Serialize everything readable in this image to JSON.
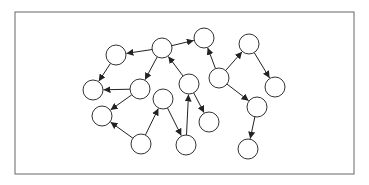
{
  "diagram": {
    "type": "directed-graph",
    "frame": {
      "x": 15,
      "y": 12,
      "width": 339,
      "height": 162,
      "stroke": "#666666"
    },
    "node_radius": 10,
    "node_stroke": "#333333",
    "node_fill": "#ffffff",
    "edge_color": "#222222",
    "nodes": [
      {
        "id": "A",
        "x": 116,
        "y": 55
      },
      {
        "id": "B",
        "x": 162,
        "y": 48
      },
      {
        "id": "C",
        "x": 93,
        "y": 90
      },
      {
        "id": "D",
        "x": 140,
        "y": 89
      },
      {
        "id": "E",
        "x": 102,
        "y": 116
      },
      {
        "id": "F",
        "x": 163,
        "y": 99
      },
      {
        "id": "G",
        "x": 141,
        "y": 144
      },
      {
        "id": "H",
        "x": 204,
        "y": 38
      },
      {
        "id": "I",
        "x": 189,
        "y": 84
      },
      {
        "id": "J",
        "x": 219,
        "y": 78
      },
      {
        "id": "K",
        "x": 249,
        "y": 44
      },
      {
        "id": "L",
        "x": 275,
        "y": 87
      },
      {
        "id": "M",
        "x": 257,
        "y": 107
      },
      {
        "id": "N",
        "x": 209,
        "y": 122
      },
      {
        "id": "O",
        "x": 186,
        "y": 145
      },
      {
        "id": "P",
        "x": 248,
        "y": 149
      }
    ],
    "edges": [
      {
        "from": "B",
        "to": "A"
      },
      {
        "from": "A",
        "to": "C"
      },
      {
        "from": "B",
        "to": "D"
      },
      {
        "from": "D",
        "to": "C"
      },
      {
        "from": "D",
        "to": "E"
      },
      {
        "from": "G",
        "to": "E"
      },
      {
        "from": "G",
        "to": "F"
      },
      {
        "from": "F",
        "to": "O"
      },
      {
        "from": "O",
        "to": "I"
      },
      {
        "from": "I",
        "to": "N"
      },
      {
        "from": "I",
        "to": "B"
      },
      {
        "from": "B",
        "to": "H"
      },
      {
        "from": "J",
        "to": "H"
      },
      {
        "from": "J",
        "to": "K"
      },
      {
        "from": "K",
        "to": "L"
      },
      {
        "from": "J",
        "to": "M"
      },
      {
        "from": "M",
        "to": "P"
      }
    ]
  }
}
